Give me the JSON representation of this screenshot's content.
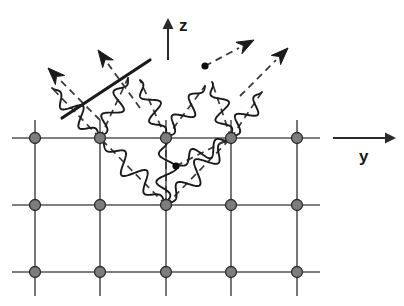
{
  "figure": {
    "width": 404,
    "height": 306,
    "background_color": "#ffffff"
  },
  "axes": {
    "vertical": {
      "label": "z",
      "icon": "arrow-up-icon",
      "direction": "up",
      "x": 168,
      "y_start": 60,
      "y_end": 18,
      "color": "#2b2b2b"
    },
    "horizontal": {
      "label": "y",
      "icon": "arrow-right-icon",
      "direction": "right",
      "y": 138,
      "x_start": 333,
      "x_end": 396,
      "color": "#2b2b2b"
    }
  },
  "lattice": {
    "line_color": "#555555",
    "node_fill": "#7d7d7d",
    "node_stroke": "#2b2b2b",
    "node_radius": 5.5,
    "columns_x": [
      35,
      100,
      166,
      231,
      297
    ],
    "rows_y": [
      138,
      205,
      272
    ],
    "row_x_start": 12,
    "row_x_end": 320,
    "col_y_start": 120,
    "col_y_end": 296,
    "node_count": 15
  },
  "wave_color": "#1a1a1a",
  "dash_color": "#3a3a3a",
  "cascade": {
    "origin": {
      "x": 166,
      "y": 205,
      "label": "primary-scattering-vertex"
    },
    "branches": [
      {
        "id": "b1",
        "from_x": 166,
        "from_y": 205,
        "to_x": 100,
        "to_y": 138,
        "amplitude": 11,
        "wavelength": 30
      },
      {
        "id": "b2",
        "from_x": 166,
        "from_y": 205,
        "to_x": 166,
        "to_y": 138,
        "amplitude": 11,
        "wavelength": 30
      },
      {
        "id": "b3",
        "from_x": 166,
        "from_y": 205,
        "to_x": 231,
        "to_y": 138,
        "amplitude": 11,
        "wavelength": 30
      },
      {
        "id": "b4",
        "from_x": 100,
        "from_y": 138,
        "to_x": 52,
        "to_y": 88,
        "amplitude": 10,
        "wavelength": 28
      },
      {
        "id": "b5",
        "from_x": 100,
        "from_y": 138,
        "to_x": 128,
        "to_y": 78,
        "amplitude": 10,
        "wavelength": 28
      },
      {
        "id": "b6",
        "from_x": 166,
        "from_y": 138,
        "to_x": 140,
        "to_y": 80,
        "amplitude": 10,
        "wavelength": 28
      },
      {
        "id": "b7",
        "from_x": 166,
        "from_y": 138,
        "to_x": 205,
        "to_y": 86,
        "amplitude": 10,
        "wavelength": 28
      },
      {
        "id": "b8",
        "from_x": 231,
        "from_y": 138,
        "to_x": 212,
        "to_y": 82,
        "amplitude": 10,
        "wavelength": 28
      },
      {
        "id": "b9",
        "from_x": 231,
        "from_y": 138,
        "to_x": 262,
        "to_y": 92,
        "amplitude": 10,
        "wavelength": 28
      },
      {
        "id": "b10",
        "from_x": 176,
        "from_y": 166,
        "to_x": 231,
        "to_y": 138,
        "amplitude": 9,
        "wavelength": 28
      }
    ],
    "secondary_vertices": [
      {
        "id": "v1",
        "x": 176,
        "y": 166,
        "label": "secondary-scattering-vertex"
      },
      {
        "id": "v2",
        "x": 205,
        "y": 66,
        "label": "secondary-scattering-vertex"
      }
    ]
  },
  "escaping_rays": [
    {
      "id": "r1",
      "from_x": 100,
      "from_y": 120,
      "to_x": 48,
      "to_y": 68,
      "direction": "up-left",
      "head": "solid-barb",
      "label": "outgoing-phonon-up-left-outer"
    },
    {
      "id": "r2",
      "from_x": 140,
      "from_y": 108,
      "to_x": 98,
      "to_y": 50,
      "direction": "up-left",
      "head": "solid-barb",
      "label": "outgoing-phonon-up-left-inner"
    },
    {
      "id": "r3",
      "from_x": 205,
      "from_y": 66,
      "to_x": 254,
      "to_y": 40,
      "direction": "up-right",
      "head": "solid-barb",
      "label": "outgoing-phonon-up-right-inner"
    },
    {
      "id": "r4",
      "from_x": 240,
      "from_y": 96,
      "to_x": 288,
      "to_y": 48,
      "direction": "up-right",
      "head": "solid-barb",
      "label": "outgoing-phonon-up-right-outer"
    }
  ],
  "solid_track": {
    "label": "ballistic-particle-track",
    "from_x": 62,
    "from_y": 118,
    "to_x": 150,
    "to_y": 60,
    "width": 3.2,
    "color": "#1a1a1a"
  }
}
